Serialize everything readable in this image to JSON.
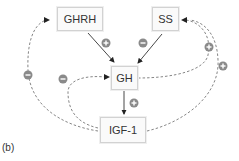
{
  "figure_label": "(b)",
  "nodes": {
    "ghrh": "GHRH",
    "ss": "SS",
    "gh": "GH",
    "igf1": "IGF-1"
  },
  "edges": [
    {
      "from": "GHRH",
      "to": "GH",
      "sign": "+",
      "style": "solid"
    },
    {
      "from": "SS",
      "to": "GH",
      "sign": "-",
      "style": "solid"
    },
    {
      "from": "GH",
      "to": "IGF-1",
      "sign": "+",
      "style": "solid"
    },
    {
      "from": "IGF-1",
      "to": "GHRH",
      "sign": "-",
      "style": "dashed"
    },
    {
      "from": "IGF-1",
      "to": "GH",
      "sign": "-",
      "style": "dashed"
    },
    {
      "from": "GH",
      "to": "SS",
      "sign": "+",
      "style": "dashed"
    },
    {
      "from": "IGF-1",
      "to": "SS",
      "sign": "+",
      "style": "dashed"
    }
  ],
  "colors": {
    "line": "#333333",
    "dashed": "#777777",
    "sign_fill": "#8a8a8a",
    "box_border": "#d2d2d2"
  }
}
